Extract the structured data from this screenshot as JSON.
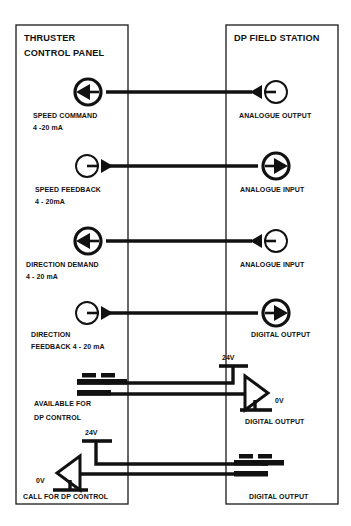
{
  "diagram": {
    "type": "schematic",
    "background_color": "#ffffff",
    "line_color": "#111111",
    "canvas": {
      "width": 351,
      "height": 526
    }
  },
  "panels": {
    "left": {
      "name": "thruster-control-panel",
      "title_line1": "THRUSTER",
      "title_line2": "CONTROL PANEL",
      "rect": {
        "x": 16,
        "y": 25,
        "width": 112,
        "height": 479
      }
    },
    "right": {
      "name": "dp-field-station",
      "title_line1": "DP FIELD STATION",
      "title_line2": "",
      "rect": {
        "x": 226,
        "y": 25,
        "width": 112,
        "height": 479
      }
    }
  },
  "signals": [
    {
      "id": "speed-command",
      "left_label_line1": "SPEED COMMAND",
      "left_label_line2": "4 -20 mA",
      "right_label_line1": "ANALOGUE OUTPUT",
      "right_label_line2": "",
      "direction": "right-to-left",
      "left_symbol": "circle-arrow-in-left",
      "right_symbol": "circle-line-arrow-left",
      "wire_y": 92
    },
    {
      "id": "speed-feedback",
      "left_label_line1": "SPEED FEEDBACK",
      "left_label_line2": "4 - 20mA",
      "right_label_line1": "ANALOGUE INPUT",
      "right_label_line2": "",
      "direction": "left-to-right",
      "left_symbol": "circle-line-arrow-right",
      "right_symbol": "circle-arrow-in-right",
      "wire_y": 166
    },
    {
      "id": "direction-demand",
      "left_label_line1": "DIRECTION DEMAND",
      "left_label_line2": "4 - 20 mA",
      "right_label_line1": "ANALOGUE INPUT",
      "right_label_line2": "",
      "direction": "right-to-left",
      "left_symbol": "circle-arrow-in-left",
      "right_symbol": "circle-line-arrow-left",
      "wire_y": 241
    },
    {
      "id": "direction-feedback",
      "left_label_line1": "DIRECTION",
      "left_label_line2": "FEEDBACK 4 - 20 mA",
      "right_label_line1": "DIGITAL OUTPUT",
      "right_label_line2": "",
      "direction": "left-to-right",
      "left_symbol": "circle-line-arrow-right",
      "right_symbol": "circle-arrow-in-right",
      "wire_y": 313
    }
  ],
  "digital_rows": [
    {
      "id": "available-for-dp-control",
      "left_label_line1": "AVAILABLE FOR",
      "left_label_line2": "DP CONTROL",
      "right_label_line1": "DIGITAL OUTPUT",
      "left_symbol": "switch-contact",
      "right_symbol": "buffer-triangle-right",
      "supply_label": "24V",
      "ground_label": "0V"
    },
    {
      "id": "call-for-dp-control",
      "left_label_line1": "CALL FOR DP CONTROL",
      "left_label_line2": "",
      "right_label_line1": "DIGITAL OUTPUT",
      "left_symbol": "buffer-triangle-left",
      "right_symbol": "switch-contact",
      "supply_label": "24V",
      "ground_label": "0V"
    }
  ]
}
